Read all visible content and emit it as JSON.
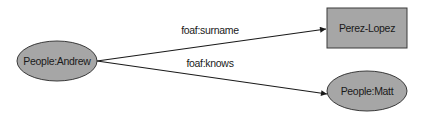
{
  "diagram": {
    "nodes": [
      {
        "id": "andrew",
        "label": "People:Andrew",
        "shape": "ellipse",
        "fill": "#a6a6a6"
      },
      {
        "id": "surname",
        "label": "Perez-Lopez",
        "shape": "rectangle",
        "fill": "#a6a6a6"
      },
      {
        "id": "matt",
        "label": "People:Matt",
        "shape": "ellipse",
        "fill": "#a6a6a6"
      }
    ],
    "edges": [
      {
        "from": "andrew",
        "to": "surname",
        "label": "foaf:surname"
      },
      {
        "from": "andrew",
        "to": "matt",
        "label": "foaf:knows"
      }
    ]
  }
}
